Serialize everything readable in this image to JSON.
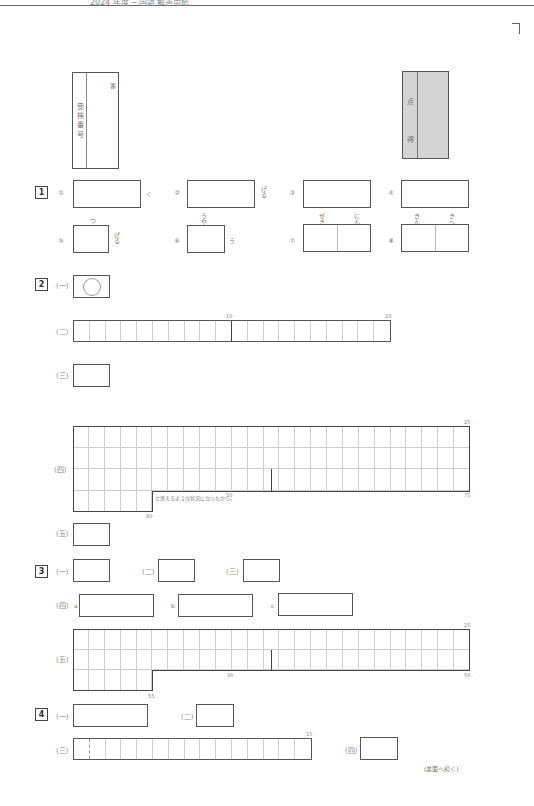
{
  "header": {
    "text": "2024 年度 ─ 国語 解答用紙",
    "continue_note": "(裏面へ続く)"
  },
  "exam_number_box": {
    "label": "受 検 番 号",
    "suffix": "番"
  },
  "score_box": {
    "label1": "得",
    "label2": "点"
  },
  "sections": [
    {
      "number": "1",
      "items": [
        {
          "mark": "①",
          "after": "く"
        },
        {
          "mark": "②",
          "after": "げる"
        },
        {
          "mark": "③",
          "after": ""
        },
        {
          "mark": "④",
          "after": ""
        },
        {
          "mark": "⑤",
          "above": "つ",
          "after": "げる"
        },
        {
          "mark": "⑥",
          "above": "うやま",
          "after": "う"
        },
        {
          "mark": "⑦",
          "above_left": "せきめ",
          "above_right": "にん"
        },
        {
          "mark": "⑧",
          "above_left": "きん",
          "above_right": "きへ"
        }
      ]
    },
    {
      "number": "2",
      "items": [
        {
          "mark": "(一)"
        },
        {
          "mark": "(二)",
          "grid_cols": 20,
          "markers": [
            "10",
            "20"
          ]
        },
        {
          "mark": "(三)"
        },
        {
          "mark": "(四)",
          "grid_cols": 25,
          "grid_rows": 4,
          "last_row_cells": 5,
          "markers": [
            "25",
            "50",
            "75",
            "80"
          ],
          "tail_text": "と思えるような状況になったから。"
        },
        {
          "mark": "(五)"
        }
      ]
    },
    {
      "number": "3",
      "items": [
        {
          "mark": "(一)"
        },
        {
          "mark": "(二)"
        },
        {
          "mark": "(三)"
        },
        {
          "mark": "(四)",
          "parts": [
            "a",
            "b",
            "c"
          ]
        },
        {
          "mark": "(五)",
          "grid_cols": 25,
          "grid_rows": 3,
          "last_row_cells": 5,
          "markers": [
            "25",
            "30",
            "50",
            "55"
          ]
        }
      ]
    },
    {
      "number": "4",
      "items": [
        {
          "mark": "(一)"
        },
        {
          "mark": "(二)"
        },
        {
          "mark": "(三)",
          "grid_cols": 15,
          "markers": [
            "15"
          ]
        },
        {
          "mark": "(四)"
        }
      ]
    }
  ]
}
